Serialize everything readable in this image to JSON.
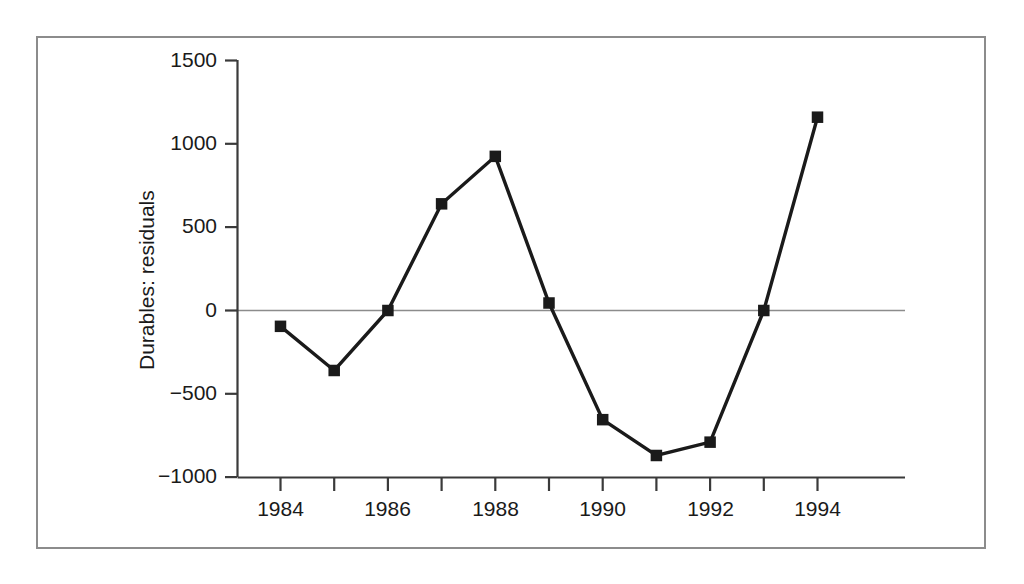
{
  "figure": {
    "background_color": "#ffffff",
    "frame_color": "#8c8c8c",
    "ink_color": "#1a1a1a",
    "zero_line_color": "#8c8c8c"
  },
  "chart_data": {
    "type": "line",
    "title": "",
    "subtitle": "",
    "xlabel": "",
    "ylabel": "Durables: residuals",
    "x": [
      1984,
      1985,
      1986,
      1987,
      1988,
      1989,
      1990,
      1991,
      1992,
      1993,
      1994
    ],
    "values": [
      -95,
      -360,
      0,
      640,
      925,
      45,
      -655,
      -870,
      -790,
      0,
      1160
    ],
    "series": [
      {
        "name": "Durables: residuals",
        "values": [
          -95,
          -360,
          0,
          640,
          925,
          45,
          -655,
          -870,
          -790,
          0,
          1160
        ],
        "marker": "square",
        "marker_color": "#1a1a1a",
        "line_color": "#1a1a1a"
      }
    ],
    "xlim": [
      1983.5,
      1994.5
    ],
    "ylim": [
      -1000,
      1500
    ],
    "y_ticks": [
      -1000,
      -500,
      0,
      500,
      1000,
      1500
    ],
    "y_tick_labels": [
      "−1000",
      "−500",
      "0",
      "500",
      "1000",
      "1500"
    ],
    "x_ticks": [
      1984,
      1985,
      1986,
      1987,
      1988,
      1989,
      1990,
      1991,
      1992,
      1993,
      1994
    ],
    "x_tick_labels_shown": [
      "1984",
      "1986",
      "1988",
      "1990",
      "1992",
      "1994"
    ],
    "x_labeled_ticks": [
      1984,
      1986,
      1988,
      1990,
      1992,
      1994
    ],
    "grid": false,
    "legend": null,
    "legend_position": "none",
    "annotations": [
      {
        "text": "zero reference line",
        "y": 0
      }
    ]
  },
  "axis_labels": {
    "y": {
      "t1500": "1500",
      "t1000": "1000",
      "t500": "500",
      "t0": "0",
      "tm500": "−500",
      "tm1000": "−1000"
    },
    "x": {
      "y1984": "1984",
      "y1986": "1986",
      "y1988": "1988",
      "y1990": "1990",
      "y1992": "1992",
      "y1994": "1994"
    },
    "title_y": "Durables: residuals"
  }
}
